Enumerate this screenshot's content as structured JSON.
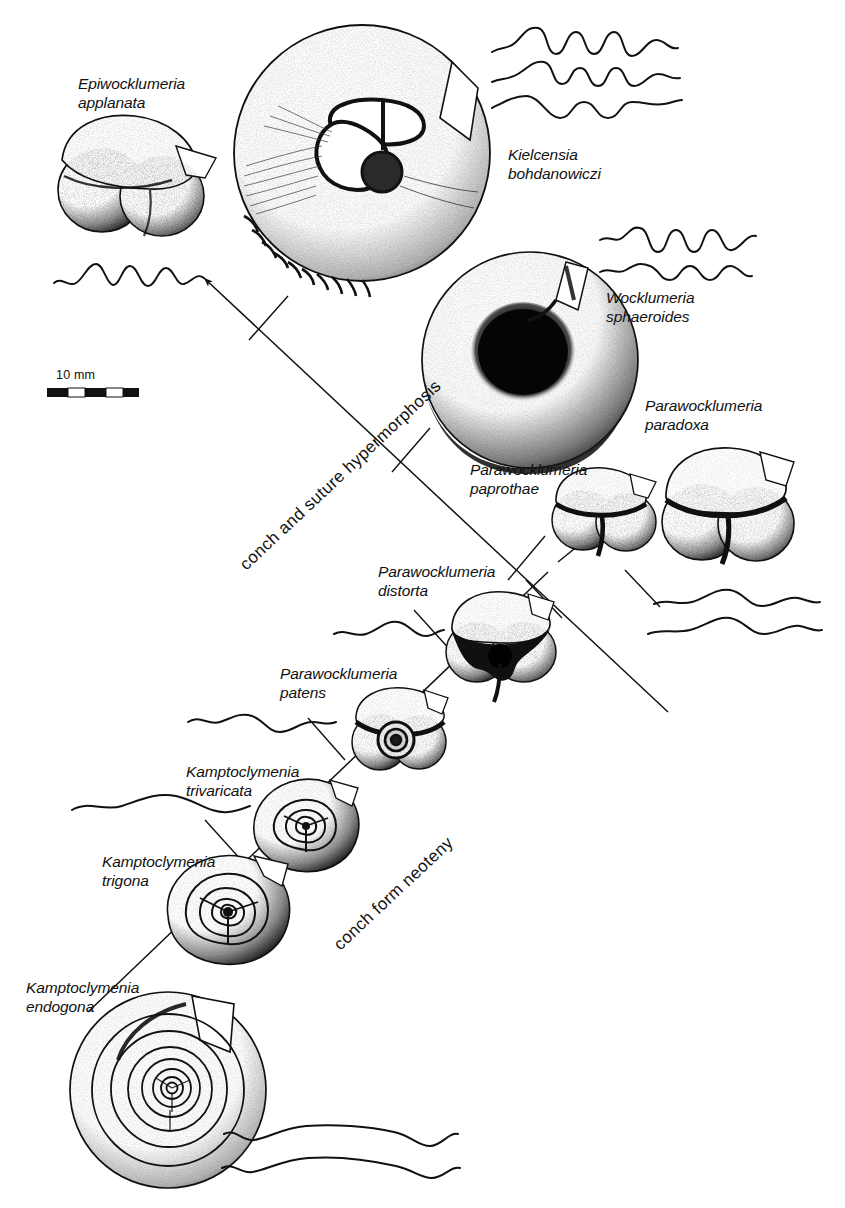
{
  "figure": {
    "title": "",
    "background_color": "#ffffff",
    "ink_color": "#111111",
    "width": 845,
    "height": 1208
  },
  "scale_bar": {
    "label": "10 mm",
    "segments": 4,
    "x": 47,
    "y": 370
  },
  "axes": [
    {
      "id": "hypermorphosis",
      "label": "conch and suture hypermorphosis",
      "direction": "up-left",
      "arrowhead": "upper-left",
      "x1": 660,
      "y1": 700,
      "x2": 200,
      "y2": 270
    },
    {
      "id": "neoteny",
      "label": "conch form neoteny",
      "direction": "up-right",
      "arrowhead": "upper-right",
      "x1": 90,
      "y1": 1000,
      "x2": 560,
      "y2": 560
    }
  ],
  "specimens": [
    {
      "id": "epiwocklumeria-applanata",
      "genus": "Epiwocklumeria",
      "species": "applanata",
      "label": "Epiwocklumeria\napplanata",
      "shape": "trilobate",
      "sutures": 1,
      "suture_complexity": "high",
      "label_x": 78,
      "label_y": 82
    },
    {
      "id": "kielcensia-bohdanowiczi",
      "genus": "Kielcensia",
      "species": "bohdanowiczi",
      "label": "Kielcensia\nbohdanowiczi",
      "shape": "discoidal",
      "sutures": 3,
      "suture_complexity": "high",
      "label_x": 508,
      "label_y": 152
    },
    {
      "id": "wocklumeria-sphaeroides",
      "genus": "Wocklumeria",
      "species": "sphaeroides",
      "label": "Wocklumeria\nsphaeroides",
      "shape": "globular",
      "sutures": 2,
      "suture_complexity": "high",
      "label_x": 608,
      "label_y": 296
    },
    {
      "id": "parawocklumeria-paradoxa",
      "genus": "Parawocklumeria",
      "species": "paradoxa",
      "label": "Parawocklumeria\nparadoxa",
      "shape": "trilobate",
      "sutures": 2,
      "suture_complexity": "medium",
      "label_x": 645,
      "label_y": 404
    },
    {
      "id": "parawocklumeria-paprothae",
      "genus": "Parawocklumeria",
      "species": "paprothae",
      "label": "Parawocklumeria\npaprothae",
      "shape": "trilobate",
      "sutures": 0,
      "suture_complexity": "medium",
      "label_x": 478,
      "label_y": 466
    },
    {
      "id": "parawocklumeria-distorta",
      "genus": "Parawocklumeria",
      "species": "distorta",
      "label": "Parawocklumeria\ndistorta",
      "shape": "trilobate",
      "sutures": 1,
      "suture_complexity": "low",
      "label_x": 381,
      "label_y": 570
    },
    {
      "id": "parawocklumeria-patens",
      "genus": "Parawocklumeria",
      "species": "patens",
      "label": "Parawocklumeria\npatens",
      "shape": "trilobate-spiral",
      "sutures": 1,
      "suture_complexity": "low",
      "label_x": 282,
      "label_y": 672
    },
    {
      "id": "kamptoclymenia-trivaricata",
      "genus": "Kamptoclymenia",
      "species": "trivaricata",
      "label": "Kamptoclymenia\ntrivaricata",
      "shape": "triangular-spiral",
      "sutures": 1,
      "suture_complexity": "low",
      "label_x": 188,
      "label_y": 770
    },
    {
      "id": "kamptoclymenia-trigona",
      "genus": "Kamptoclymenia",
      "species": "trigona",
      "label": "Kamptoclymenia\ntrigona",
      "shape": "triangular-spiral",
      "sutures": 1,
      "suture_complexity": "low",
      "label_x": 104,
      "label_y": 860
    },
    {
      "id": "kamptoclymenia-endogona",
      "genus": "Kamptoclymenia",
      "species": "endogona",
      "label": "Kamptoclymenia\nendogona",
      "shape": "evolute-spiral",
      "sutures": 2,
      "suture_complexity": "very-low",
      "label_x": 28,
      "label_y": 985
    }
  ]
}
